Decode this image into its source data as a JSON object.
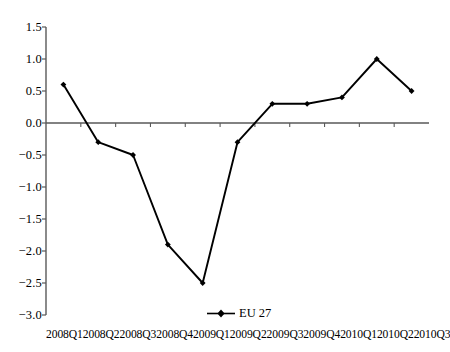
{
  "chart_data": {
    "type": "line",
    "title": "",
    "subtitle": "",
    "xlabel": "",
    "ylabel": "",
    "categories": [
      "2008Q1",
      "2008Q2",
      "2008Q3",
      "2008Q4",
      "2009Q1",
      "2009Q2",
      "2009Q3",
      "2009Q4",
      "2010Q1",
      "2010Q2",
      "2010Q3"
    ],
    "series": [
      {
        "name": "EU 27",
        "values": [
          0.6,
          -0.3,
          -0.5,
          -1.9,
          -2.5,
          -0.3,
          0.3,
          0.3,
          0.4,
          1.0,
          0.5
        ],
        "color": "#000000",
        "marker": "diamond"
      }
    ],
    "ylim": [
      -3.0,
      1.5
    ],
    "y_ticks": [
      "1.5",
      "1.0",
      "0.5",
      "0.0",
      "-0.5",
      "-1.0",
      "-1.5",
      "-2.0",
      "-2.5",
      "-3.0"
    ],
    "y_tick_values": [
      1.5,
      1.0,
      0.5,
      0.0,
      -0.5,
      -1.0,
      -1.5,
      -2.0,
      -2.5,
      -3.0
    ],
    "grid": false,
    "zero_line": true,
    "legend": {
      "position": "bottom-center",
      "entries": [
        {
          "label": "EU 27",
          "marker": "diamond",
          "color": "#000000"
        }
      ]
    },
    "axis_color": "#595959",
    "line_color": "#000000"
  }
}
